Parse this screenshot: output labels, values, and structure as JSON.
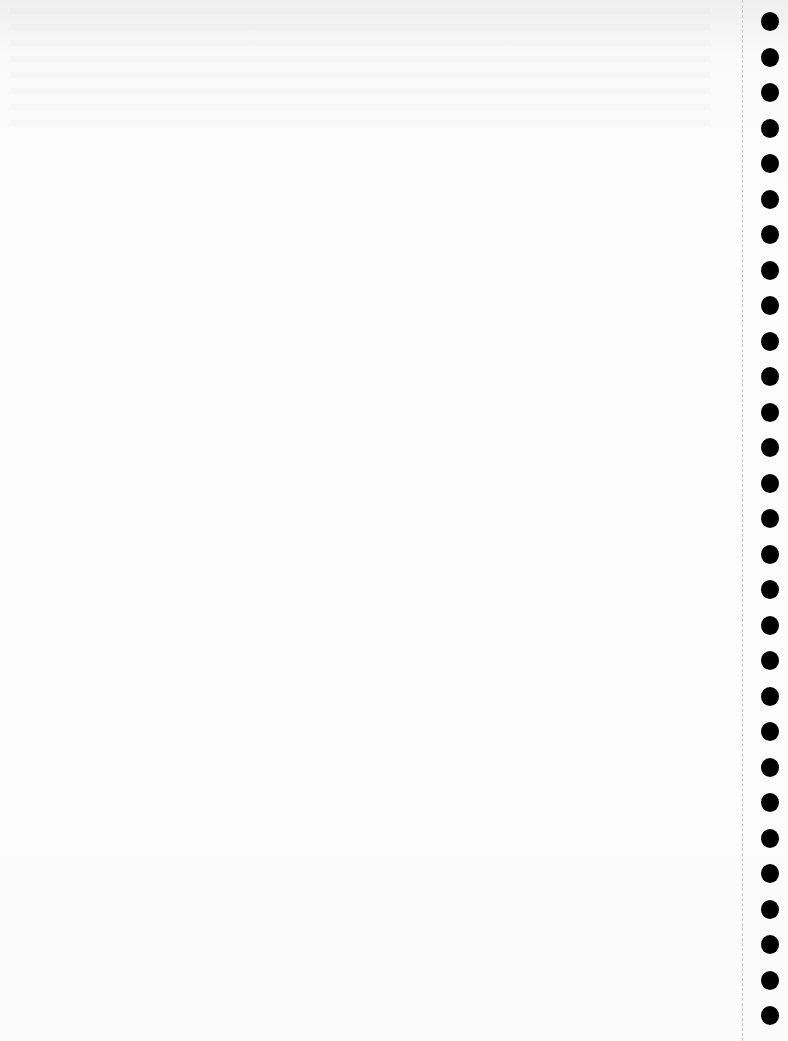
{
  "page": {
    "type": "blank notebook sheet",
    "colors": {
      "paper": "#fafafa",
      "holes": "#000000",
      "perforation": "#c8c8c8"
    },
    "hole_count": 29,
    "hole_spacing_px": 35.5,
    "first_hole_top_px": 12
  }
}
